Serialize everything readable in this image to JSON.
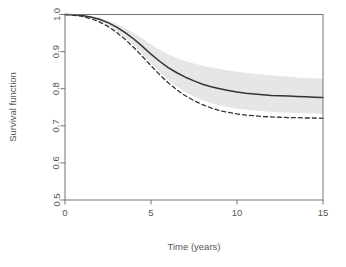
{
  "chart_data": {
    "type": "line",
    "title": "",
    "xlabel": "Time (years)",
    "ylabel": "Survival function",
    "xlim": [
      0,
      15
    ],
    "ylim": [
      0.5,
      1.0
    ],
    "xticks": [
      0,
      5,
      10,
      15
    ],
    "xticklabels": [
      "0",
      "5",
      "10",
      "15"
    ],
    "yticks": [
      0.5,
      0.6,
      0.7,
      0.8,
      0.9,
      1.0
    ],
    "yticklabels": [
      "0.5",
      "0.6",
      "0.7",
      "0.8",
      "0.9",
      "1.0"
    ],
    "grid": false,
    "legend": "none",
    "x": [
      0,
      0.5,
      1,
      1.5,
      2,
      2.5,
      3,
      3.5,
      4,
      4.5,
      5,
      5.5,
      6,
      6.5,
      7,
      7.5,
      8,
      8.5,
      9,
      9.5,
      10,
      10.5,
      11,
      11.5,
      12,
      12.5,
      13,
      13.5,
      14,
      14.5,
      15
    ],
    "series": [
      {
        "name": "Model-based survival (solid)",
        "style": "solid",
        "color": "#333333",
        "values": [
          1.0,
          0.999,
          0.997,
          0.993,
          0.987,
          0.978,
          0.966,
          0.951,
          0.934,
          0.914,
          0.893,
          0.874,
          0.857,
          0.843,
          0.831,
          0.821,
          0.812,
          0.805,
          0.8,
          0.795,
          0.791,
          0.788,
          0.786,
          0.784,
          0.782,
          0.781,
          0.78,
          0.779,
          0.778,
          0.777,
          0.776
        ]
      },
      {
        "name": "Reference survival (dashed)",
        "style": "dashed",
        "color": "#333333",
        "values": [
          1.0,
          0.998,
          0.995,
          0.989,
          0.98,
          0.968,
          0.952,
          0.933,
          0.911,
          0.887,
          0.862,
          0.838,
          0.816,
          0.797,
          0.781,
          0.768,
          0.757,
          0.748,
          0.741,
          0.736,
          0.732,
          0.729,
          0.727,
          0.725,
          0.724,
          0.723,
          0.722,
          0.722,
          0.721,
          0.721,
          0.72
        ]
      }
    ],
    "confidence_band": {
      "name": "95% confidence band (solid curve)",
      "fill": "#e6e6e6",
      "upper": [
        1.0,
        0.999,
        0.998,
        0.995,
        0.991,
        0.984,
        0.975,
        0.963,
        0.95,
        0.935,
        0.919,
        0.905,
        0.893,
        0.883,
        0.875,
        0.868,
        0.862,
        0.857,
        0.853,
        0.849,
        0.846,
        0.843,
        0.84,
        0.838,
        0.836,
        0.834,
        0.832,
        0.83,
        0.829,
        0.828,
        0.827
      ],
      "lower": [
        1.0,
        0.999,
        0.996,
        0.991,
        0.983,
        0.972,
        0.957,
        0.939,
        0.918,
        0.894,
        0.869,
        0.845,
        0.824,
        0.806,
        0.791,
        0.779,
        0.769,
        0.761,
        0.755,
        0.75,
        0.746,
        0.743,
        0.741,
        0.739,
        0.737,
        0.736,
        0.735,
        0.734,
        0.733,
        0.733,
        0.732
      ]
    }
  }
}
